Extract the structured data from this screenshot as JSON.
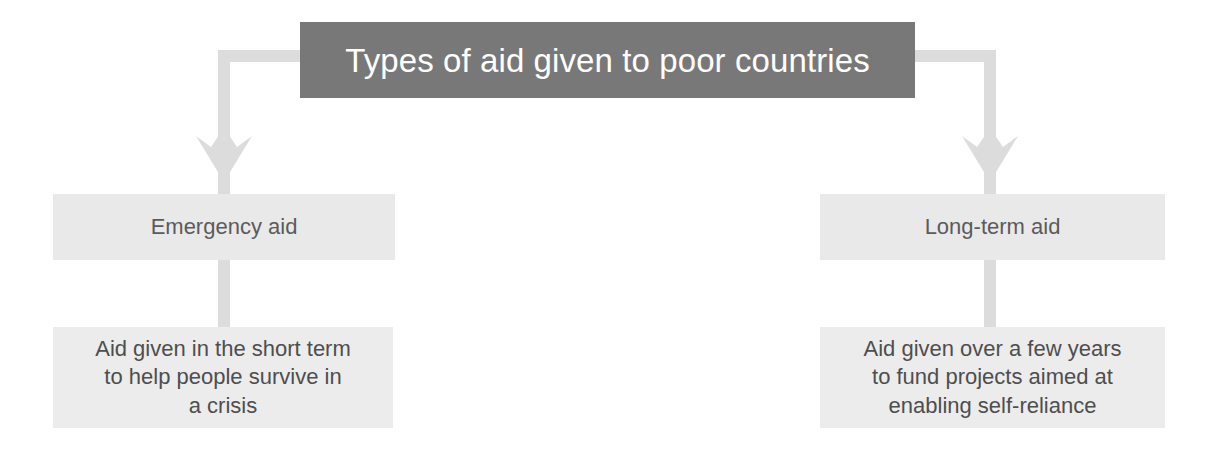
{
  "diagram": {
    "kind": "hierarchy-flowchart",
    "colors": {
      "title_box_fill": "#787878",
      "title_text": "#ffffff",
      "mid_box_fill": "#e9e9e9",
      "leaf_box_fill": "#ececec",
      "body_text": "#4e4e4e",
      "connector": "#dcdcdc",
      "page_background": "#ffffff"
    },
    "title": {
      "label": "Types of aid given to poor countries"
    },
    "branches": [
      {
        "id": "emergency",
        "category_label": "Emergency aid",
        "description_lines": [
          "Aid given in the short term",
          "to help people survive in",
          "a crisis"
        ]
      },
      {
        "id": "long-term",
        "category_label": "Long-term aid",
        "description_lines": [
          "Aid given over a few years",
          "to fund projects aimed at",
          "enabling self-reliance"
        ]
      }
    ]
  }
}
